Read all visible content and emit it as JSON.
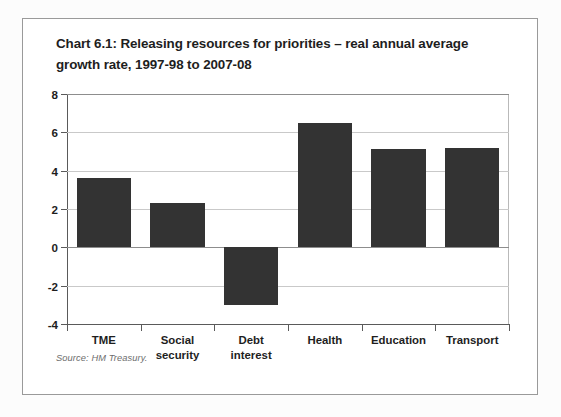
{
  "figure": {
    "title": "Chart 6.1: Releasing resources for priorities – real annual average growth rate, 1997-98 to 2007-08",
    "source": "Source: HM Treasury."
  },
  "chart_data": {
    "type": "bar",
    "title": "Chart 6.1: Releasing resources for priorities – real annual average growth rate, 1997-98 to 2007-08",
    "xlabel": "",
    "ylabel": "",
    "ylim": [
      -4,
      8
    ],
    "yticks": [
      -4,
      -2,
      0,
      2,
      4,
      6,
      8
    ],
    "ytick_labels": [
      "-4",
      "-2",
      "0",
      "2",
      "4",
      "6",
      "8"
    ],
    "grid": true,
    "legend": false,
    "bar_color": "#333333",
    "categories": [
      "TME",
      "Social security",
      "Debt interest",
      "Health",
      "Education",
      "Transport"
    ],
    "category_labels": [
      [
        "TME"
      ],
      [
        "Social",
        "security"
      ],
      [
        "Debt",
        "interest"
      ],
      [
        "Health"
      ],
      [
        "Education"
      ],
      [
        "Transport"
      ]
    ],
    "values": [
      3.6,
      2.3,
      -3.0,
      6.5,
      5.15,
      5.2
    ],
    "series": [
      {
        "name": "Real annual average growth rate",
        "values": [
          3.6,
          2.3,
          -3.0,
          6.5,
          5.15,
          5.2
        ]
      }
    ]
  }
}
